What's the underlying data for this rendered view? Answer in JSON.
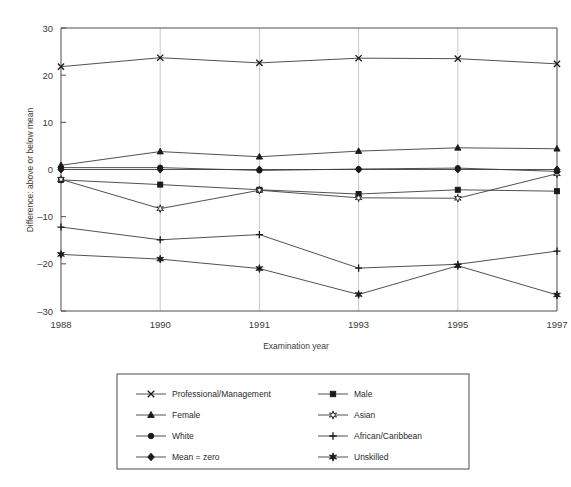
{
  "chart_data": {
    "type": "line",
    "title": "",
    "xlabel": "Examination year",
    "ylabel": "Difference: above or below mean",
    "categories": [
      "1988",
      "1990",
      "1991",
      "1993",
      "1995",
      "1997"
    ],
    "x": [
      1988,
      1990,
      1991,
      1993,
      1995,
      1997
    ],
    "xtick_labels": [
      "1988",
      "1990",
      "1991",
      "1993",
      "1995",
      "1997"
    ],
    "ytick_labels": [
      "30",
      "20",
      "10",
      "0",
      "-10",
      "-20",
      "-30"
    ],
    "ytick_values": [
      30,
      20,
      10,
      0,
      -10,
      -20,
      -30
    ],
    "ylim": [
      -30,
      30
    ],
    "grid": "vertical",
    "legend_position": "below-plot",
    "series": [
      {
        "name": "Professional/Management",
        "marker": "x-cross",
        "values": [
          21.8,
          23.7,
          22.6,
          23.6,
          23.5,
          22.4
        ]
      },
      {
        "name": "Male",
        "marker": "filled-square",
        "values": [
          -2.2,
          -3.2,
          -4.3,
          -5.2,
          -4.3,
          -4.6
        ]
      },
      {
        "name": "Female",
        "marker": "filled-triangle",
        "values": [
          0.9,
          3.8,
          2.7,
          3.9,
          4.6,
          4.4
        ]
      },
      {
        "name": "Asian",
        "marker": "open-star",
        "values": [
          -2.1,
          -8.3,
          -4.4,
          -6.0,
          -6.1,
          -0.9
        ]
      },
      {
        "name": "White",
        "marker": "filled-circle",
        "values": [
          0.4,
          0.4,
          -0.2,
          0.1,
          0.3,
          -0.4
        ]
      },
      {
        "name": "African/Caribbean",
        "marker": "plus",
        "values": [
          -12.2,
          -14.9,
          -13.8,
          -20.9,
          -20.1,
          -17.3
        ]
      },
      {
        "name": "Mean = zero",
        "marker": "filled-diamond",
        "values": [
          0.0,
          0.0,
          0.0,
          0.0,
          0.0,
          0.0
        ]
      },
      {
        "name": "Unskilled",
        "marker": "filled-star",
        "values": [
          -18.0,
          -19.0,
          -21.0,
          -26.5,
          -20.4,
          -26.6
        ]
      }
    ]
  },
  "axes": {
    "y_title": "Difference: above or below mean",
    "x_title": "Examination year"
  },
  "legend": {
    "column_left": [
      {
        "label": "Professional/Management",
        "marker": "x-cross"
      },
      {
        "label": "Female",
        "marker": "filled-triangle"
      },
      {
        "label": "White",
        "marker": "filled-circle"
      },
      {
        "label": "Mean = zero",
        "marker": "filled-diamond"
      }
    ],
    "column_right": [
      {
        "label": "Male",
        "marker": "filled-square"
      },
      {
        "label": "Asian",
        "marker": "open-star"
      },
      {
        "label": "African/Caribbean",
        "marker": "plus"
      },
      {
        "label": "Unskilled",
        "marker": "filled-star"
      }
    ]
  },
  "colors": {
    "line": "#3d3d3d",
    "marker": "#1a1a1a",
    "grid": "#c9c9c9",
    "axis": "#4d4d4d",
    "background": "#ffffff"
  }
}
